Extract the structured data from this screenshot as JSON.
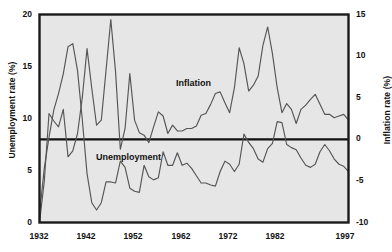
{
  "figure": {
    "background_color": "#ffffff",
    "plot_background_color": "#e6e6e6",
    "frame_color": "#1a1a1a",
    "line_color": "#555555",
    "zero_line_color": "#111111"
  },
  "chart_data": {
    "type": "line",
    "title": "",
    "xlabel": "",
    "grid": false,
    "legend_position": "inline-annotations",
    "x_axis": {
      "label": "",
      "ticks": [
        1932,
        1942,
        1952,
        1962,
        1972,
        1982,
        1997
      ],
      "tick_labels": [
        "1932",
        "1942",
        "1952",
        "1962",
        "1972",
        "1982",
        "1997"
      ],
      "xlim": [
        1932,
        1997
      ]
    },
    "y_axis_left": {
      "label": "Unemployment rate (%)",
      "ticks": [
        0,
        5,
        10,
        15,
        20
      ],
      "tick_labels": [
        "0",
        "5",
        "10",
        "15",
        "20"
      ],
      "ylim": [
        0,
        20
      ]
    },
    "y_axis_right": {
      "label": "Inflation rate (%)",
      "ticks": [
        -10,
        -5,
        0,
        5,
        10,
        15
      ],
      "tick_labels": [
        "-10",
        "-5",
        "0",
        "5",
        "10",
        "15"
      ],
      "ylim": [
        -10,
        15
      ]
    },
    "annotations": [
      {
        "text": "Inflation",
        "x": 1962,
        "y_right": 7.0
      },
      {
        "text": "Unemployment",
        "x": 1949,
        "y_left": 6.4
      }
    ],
    "series": [
      {
        "name": "Unemployment",
        "axis": "left",
        "units": "%",
        "x": [
          1932,
          1933,
          1934,
          1935,
          1936,
          1937,
          1938,
          1939,
          1940,
          1941,
          1942,
          1943,
          1944,
          1945,
          1946,
          1947,
          1948,
          1949,
          1950,
          1951,
          1952,
          1953,
          1954,
          1955,
          1956,
          1957,
          1958,
          1959,
          1960,
          1961,
          1962,
          1963,
          1964,
          1965,
          1966,
          1967,
          1968,
          1969,
          1970,
          1971,
          1972,
          1973,
          1974,
          1975,
          1976,
          1977,
          1978,
          1979,
          1980,
          1981,
          1982,
          1983,
          1984,
          1985,
          1986,
          1987,
          1988,
          1989,
          1990,
          1991,
          1992,
          1993,
          1994,
          1995,
          1996,
          1997
        ],
        "values": [
          0.8,
          5.2,
          8.2,
          10.8,
          12.4,
          14.3,
          16.9,
          17.2,
          14.6,
          9.9,
          4.7,
          1.9,
          1.2,
          1.9,
          3.9,
          3.9,
          3.8,
          5.9,
          5.3,
          3.3,
          3.0,
          2.9,
          5.5,
          4.4,
          4.1,
          4.3,
          6.8,
          5.5,
          5.5,
          6.7,
          5.5,
          5.7,
          5.2,
          4.5,
          3.8,
          3.8,
          3.6,
          3.5,
          4.9,
          5.9,
          5.6,
          4.9,
          5.6,
          8.5,
          7.7,
          7.1,
          6.1,
          5.8,
          7.1,
          7.6,
          9.7,
          9.6,
          7.5,
          7.2,
          7.0,
          6.2,
          5.5,
          5.3,
          5.6,
          6.8,
          7.5,
          6.9,
          6.1,
          5.6,
          5.4,
          4.9
        ]
      },
      {
        "name": "Inflation",
        "axis": "right",
        "units": "%",
        "x": [
          1932,
          1933,
          1934,
          1935,
          1936,
          1937,
          1938,
          1939,
          1940,
          1941,
          1942,
          1943,
          1944,
          1945,
          1946,
          1947,
          1948,
          1949,
          1950,
          1951,
          1952,
          1953,
          1954,
          1955,
          1956,
          1957,
          1958,
          1959,
          1960,
          1961,
          1962,
          1963,
          1964,
          1965,
          1966,
          1967,
          1968,
          1969,
          1970,
          1971,
          1972,
          1973,
          1974,
          1975,
          1976,
          1977,
          1978,
          1979,
          1980,
          1981,
          1982,
          1983,
          1984,
          1985,
          1986,
          1987,
          1988,
          1989,
          1990,
          1991,
          1992,
          1993,
          1994,
          1995,
          1996,
          1997
        ],
        "values": [
          -10.0,
          -5.1,
          3.1,
          2.2,
          1.5,
          3.6,
          -2.1,
          -1.4,
          0.7,
          5.0,
          10.9,
          6.1,
          1.7,
          2.3,
          8.3,
          14.4,
          8.1,
          -1.2,
          1.3,
          7.9,
          2.3,
          0.8,
          0.5,
          -0.4,
          1.5,
          3.3,
          2.8,
          0.7,
          1.7,
          1.0,
          1.0,
          1.3,
          1.3,
          1.6,
          2.9,
          3.1,
          4.2,
          5.5,
          5.7,
          4.4,
          3.2,
          6.2,
          11.0,
          9.1,
          5.8,
          6.5,
          7.6,
          11.3,
          13.5,
          10.3,
          6.2,
          3.2,
          4.3,
          3.6,
          1.9,
          3.6,
          4.1,
          4.8,
          5.4,
          4.2,
          3.0,
          3.0,
          2.6,
          2.8,
          3.0,
          2.3
        ]
      }
    ]
  }
}
